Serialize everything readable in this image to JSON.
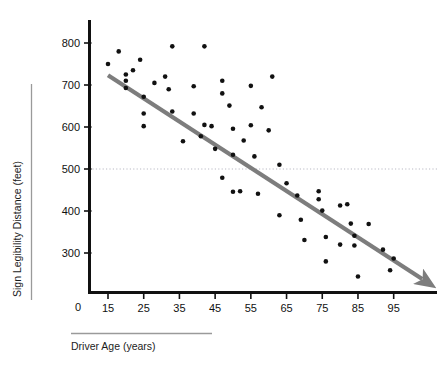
{
  "chart_data": {
    "type": "scatter",
    "title": "",
    "xlabel": "Driver Age (years)",
    "ylabel": "Sign Legibility Distance (feet)",
    "xlim": [
      10,
      103
    ],
    "ylim": [
      0,
      840
    ],
    "grid": false,
    "legend": "none",
    "x_ticks": [
      15,
      25,
      35,
      45,
      55,
      65,
      75,
      85,
      95
    ],
    "y_ticks": [
      300,
      400,
      500,
      600,
      700,
      800
    ],
    "y_origin_label": "0",
    "x_tick_labels": [
      "15",
      "25",
      "35",
      "45",
      "55",
      "65",
      "75",
      "85",
      "95"
    ],
    "y_tick_labels": [
      "800",
      "700",
      "600",
      "500",
      "400",
      "300"
    ],
    "series": [
      {
        "name": "Drivers",
        "marker": "circle",
        "color": "#111111",
        "points": [
          [
            15,
            750
          ],
          [
            18,
            780
          ],
          [
            20,
            725
          ],
          [
            20,
            710
          ],
          [
            20,
            693
          ],
          [
            22,
            735
          ],
          [
            24,
            760
          ],
          [
            25,
            672
          ],
          [
            25,
            632
          ],
          [
            25,
            602
          ],
          [
            28,
            705
          ],
          [
            31,
            720
          ],
          [
            32,
            690
          ],
          [
            33,
            637
          ],
          [
            33,
            792
          ],
          [
            36,
            566
          ],
          [
            39,
            697
          ],
          [
            39,
            632
          ],
          [
            41,
            578
          ],
          [
            42,
            792
          ],
          [
            42,
            605
          ],
          [
            44,
            602
          ],
          [
            45,
            548
          ],
          [
            47,
            710
          ],
          [
            47,
            680
          ],
          [
            47,
            479
          ],
          [
            49,
            651
          ],
          [
            50,
            596
          ],
          [
            50,
            534
          ],
          [
            50,
            446
          ],
          [
            52,
            447
          ],
          [
            53,
            568
          ],
          [
            55,
            604
          ],
          [
            55,
            698
          ],
          [
            56,
            530
          ],
          [
            57,
            441
          ],
          [
            58,
            647
          ],
          [
            60,
            592
          ],
          [
            61,
            720
          ],
          [
            63,
            510
          ],
          [
            63,
            390
          ],
          [
            65,
            466
          ],
          [
            68,
            437
          ],
          [
            69,
            379
          ],
          [
            70,
            331
          ],
          [
            74,
            447
          ],
          [
            74,
            428
          ],
          [
            75,
            401
          ],
          [
            76,
            338
          ],
          [
            76,
            280
          ],
          [
            80,
            413
          ],
          [
            80,
            320
          ],
          [
            82,
            416
          ],
          [
            83,
            370
          ],
          [
            84,
            341
          ],
          [
            84,
            318
          ],
          [
            85,
            244
          ],
          [
            88,
            369
          ],
          [
            92,
            308
          ],
          [
            94,
            259
          ],
          [
            95,
            287
          ]
        ]
      }
    ],
    "trendline": {
      "name": "regression-trendline",
      "color": "#7d7d7d",
      "from": [
        15,
        723
      ],
      "to": [
        103,
        238
      ],
      "arrow": true
    },
    "reference_line": {
      "name": "reference-line-500",
      "value": 500,
      "orientation": "horizontal",
      "style": "dotted",
      "color": "#b9b9c4"
    }
  },
  "decor": {
    "ylabel_rule_color": "#9a9a9a",
    "xlabel_rule_color": "#9a9a9a",
    "axis_color": "#111111"
  }
}
